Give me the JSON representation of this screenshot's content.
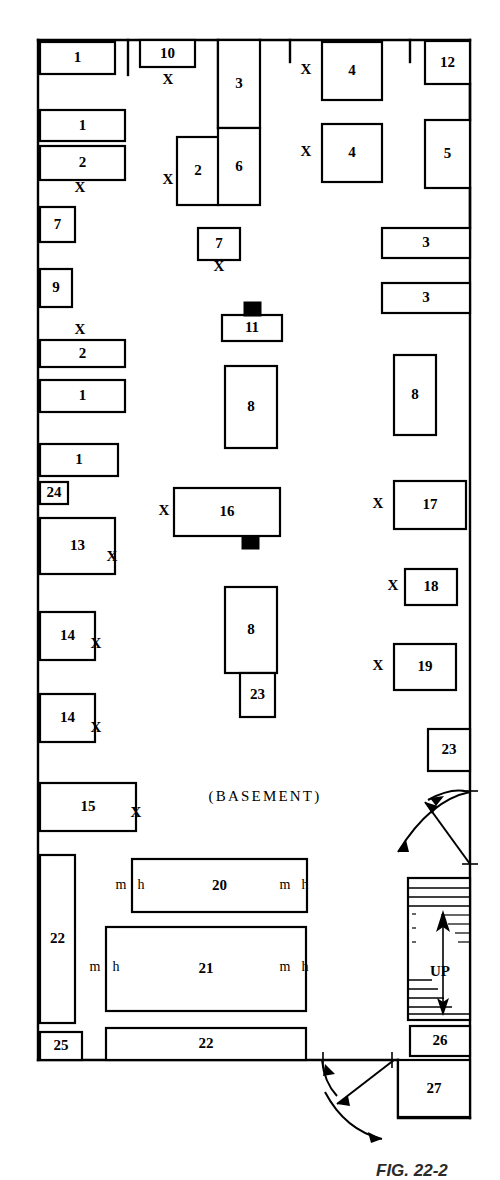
{
  "figure": {
    "caption": "FIG. 22-2",
    "area_label": "(BASEMENT)",
    "stair_label": "UP"
  },
  "markers": {
    "x": "X",
    "m": "m",
    "h": "h"
  },
  "rooms": [
    {
      "id": "r1",
      "label": "1",
      "x": 40,
      "y": 42,
      "w": 75,
      "h": 32
    },
    {
      "id": "r2",
      "label": "10",
      "x": 140,
      "y": 40,
      "w": 55,
      "h": 27
    },
    {
      "id": "r3",
      "label": "3",
      "x": 218,
      "y": 40,
      "w": 42,
      "h": 88
    },
    {
      "id": "r4",
      "label": "4",
      "x": 322,
      "y": 42,
      "w": 60,
      "h": 58
    },
    {
      "id": "r5",
      "label": "12",
      "x": 425,
      "y": 41,
      "w": 45,
      "h": 43
    },
    {
      "id": "r6",
      "label": "1",
      "x": 40,
      "y": 110,
      "w": 85,
      "h": 31
    },
    {
      "id": "r7",
      "label": "2",
      "x": 40,
      "y": 146,
      "w": 85,
      "h": 34
    },
    {
      "id": "r8",
      "label": "2",
      "x": 177,
      "y": 137,
      "w": 42,
      "h": 68
    },
    {
      "id": "r9",
      "label": "6",
      "x": 218,
      "y": 128,
      "w": 42,
      "h": 77
    },
    {
      "id": "r10",
      "label": "4",
      "x": 322,
      "y": 124,
      "w": 60,
      "h": 58
    },
    {
      "id": "r11",
      "label": "5",
      "x": 425,
      "y": 120,
      "w": 45,
      "h": 68
    },
    {
      "id": "r12",
      "label": "7",
      "x": 40,
      "y": 207,
      "w": 35,
      "h": 35
    },
    {
      "id": "r13",
      "label": "7",
      "x": 198,
      "y": 228,
      "w": 42,
      "h": 32
    },
    {
      "id": "r14",
      "label": "3",
      "x": 382,
      "y": 228,
      "w": 88,
      "h": 30
    },
    {
      "id": "r15",
      "label": "9",
      "x": 40,
      "y": 269,
      "w": 32,
      "h": 38
    },
    {
      "id": "r16",
      "label": "3",
      "x": 382,
      "y": 283,
      "w": 88,
      "h": 30
    },
    {
      "id": "r17",
      "label": "11",
      "x": 222,
      "y": 315,
      "w": 60,
      "h": 26
    },
    {
      "id": "r18",
      "label": "2",
      "x": 40,
      "y": 340,
      "w": 85,
      "h": 27
    },
    {
      "id": "r19",
      "label": "1",
      "x": 40,
      "y": 380,
      "w": 85,
      "h": 32
    },
    {
      "id": "r20",
      "label": "8",
      "x": 225,
      "y": 366,
      "w": 52,
      "h": 82
    },
    {
      "id": "r21",
      "label": "8",
      "x": 394,
      "y": 355,
      "w": 42,
      "h": 80
    },
    {
      "id": "r22",
      "label": "1",
      "x": 40,
      "y": 444,
      "w": 78,
      "h": 32
    },
    {
      "id": "r23",
      "label": "24",
      "x": 40,
      "y": 482,
      "w": 28,
      "h": 22
    },
    {
      "id": "r24",
      "label": "16",
      "x": 174,
      "y": 488,
      "w": 106,
      "h": 48
    },
    {
      "id": "r25",
      "label": "17",
      "x": 394,
      "y": 481,
      "w": 72,
      "h": 48
    },
    {
      "id": "r26",
      "label": "13",
      "x": 40,
      "y": 518,
      "w": 75,
      "h": 56
    },
    {
      "id": "r27",
      "label": "18",
      "x": 405,
      "y": 569,
      "w": 52,
      "h": 36
    },
    {
      "id": "r28",
      "label": "8",
      "x": 225,
      "y": 587,
      "w": 52,
      "h": 86
    },
    {
      "id": "r29",
      "label": "19",
      "x": 394,
      "y": 644,
      "w": 62,
      "h": 46
    },
    {
      "id": "r30",
      "label": "14",
      "x": 40,
      "y": 612,
      "w": 55,
      "h": 48
    },
    {
      "id": "r31",
      "label": "23",
      "x": 240,
      "y": 673,
      "w": 35,
      "h": 44
    },
    {
      "id": "r32",
      "label": "14",
      "x": 40,
      "y": 694,
      "w": 55,
      "h": 48
    },
    {
      "id": "r33",
      "label": "23",
      "x": 428,
      "y": 729,
      "w": 42,
      "h": 42
    },
    {
      "id": "r34",
      "label": "15",
      "x": 40,
      "y": 783,
      "w": 96,
      "h": 48
    },
    {
      "id": "r35",
      "label": "20",
      "x": 132,
      "y": 859,
      "w": 175,
      "h": 53
    },
    {
      "id": "r36",
      "label": "22",
      "x": 40,
      "y": 855,
      "w": 35,
      "h": 168
    },
    {
      "id": "r37",
      "label": "21",
      "x": 106,
      "y": 927,
      "w": 200,
      "h": 84
    },
    {
      "id": "r38",
      "label": "25",
      "x": 40,
      "y": 1032,
      "w": 42,
      "h": 28
    },
    {
      "id": "r39",
      "label": "22",
      "x": 106,
      "y": 1028,
      "w": 200,
      "h": 32
    },
    {
      "id": "r40",
      "label": "26",
      "x": 410,
      "y": 1026,
      "w": 60,
      "h": 30
    },
    {
      "id": "r41",
      "label": "27",
      "x": 398,
      "y": 1060,
      "w": 72,
      "h": 57
    }
  ],
  "x_markers": [
    {
      "x": 168,
      "y": 81
    },
    {
      "x": 306,
      "y": 71
    },
    {
      "x": 168,
      "y": 181
    },
    {
      "x": 306,
      "y": 153
    },
    {
      "x": 219,
      "y": 268
    },
    {
      "x": 80,
      "y": 189
    },
    {
      "x": 80,
      "y": 331
    },
    {
      "x": 164,
      "y": 512
    },
    {
      "x": 378,
      "y": 505
    },
    {
      "x": 393,
      "y": 587
    },
    {
      "x": 378,
      "y": 667
    },
    {
      "x": 112,
      "y": 558
    },
    {
      "x": 96,
      "y": 645
    },
    {
      "x": 96,
      "y": 729
    },
    {
      "x": 136,
      "y": 814
    }
  ],
  "mh_markers": [
    {
      "m_x": 121,
      "h_x": 141,
      "y": 886
    },
    {
      "m_x": 285,
      "h_x": 305,
      "y": 886
    },
    {
      "m_x": 95,
      "h_x": 116,
      "y": 968
    },
    {
      "m_x": 285,
      "h_x": 305,
      "y": 968
    }
  ],
  "basement_text_pos": {
    "x": 265,
    "y": 798
  },
  "stair": {
    "x": 408,
    "y": 878,
    "w": 62,
    "h": 142,
    "label_x": 440,
    "label_y": 973
  },
  "colors": {
    "line": "#000000",
    "fill": "#ffffff",
    "caption": "#2b2b2b"
  }
}
